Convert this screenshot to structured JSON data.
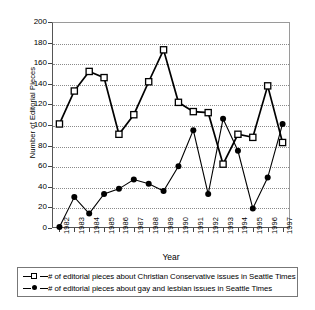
{
  "chart_data": {
    "type": "line",
    "title": "",
    "xlabel": "Year",
    "ylabel": "Number of Editorial Pieces",
    "categories": [
      "1982",
      "1983",
      "1984",
      "1985",
      "1986",
      "1987",
      "1988",
      "1989",
      "1990",
      "1991",
      "1992",
      "1993",
      "1994",
      "1995",
      "1996",
      "1997"
    ],
    "x": [
      1982,
      1983,
      1984,
      1985,
      1986,
      1987,
      1988,
      1989,
      1990,
      1991,
      1992,
      1993,
      1994,
      1995,
      1996,
      1997
    ],
    "ylim": [
      0,
      200
    ],
    "ytick_step": 20,
    "yticks": [
      0,
      20,
      40,
      60,
      80,
      100,
      120,
      140,
      160,
      180,
      200
    ],
    "grid": true,
    "legend_position": "below-plot",
    "series": [
      {
        "name": "# of editorial pieces about Christian Conservative issues in Seattle Times",
        "marker": "open-square",
        "color": "#000000",
        "values": [
          101,
          133,
          152,
          146,
          91,
          110,
          142,
          173,
          122,
          113,
          112,
          62,
          91,
          88,
          138,
          83
        ]
      },
      {
        "name": "# of editorial pieces about gay and lesbian issues in Seattle Times",
        "marker": "filled-circle",
        "color": "#000000",
        "values": [
          1,
          30,
          14,
          33,
          38,
          47,
          43,
          36,
          60,
          95,
          33,
          106,
          75,
          19,
          49,
          101
        ]
      }
    ]
  },
  "axes": {
    "y_title": "Number of Editorial Pieces",
    "x_title": "Year",
    "y_labels": [
      "200",
      "180",
      "160",
      "140",
      "120",
      "100",
      "80",
      "60",
      "40",
      "20",
      "0"
    ],
    "x_labels": [
      "1982",
      "1983",
      "1984",
      "1985",
      "1986",
      "1987",
      "1988",
      "1989",
      "1990",
      "1991",
      "1992",
      "1993",
      "1994",
      "1995",
      "1996",
      "1997"
    ]
  },
  "legend": {
    "entries": [
      {
        "marker": "open-square",
        "label": "# of editorial pieces about Christian Conservative issues in Seattle Times"
      },
      {
        "marker": "filled-circle",
        "label": "# of editorial pieces about gay and lesbian issues in Seattle Times"
      }
    ]
  }
}
